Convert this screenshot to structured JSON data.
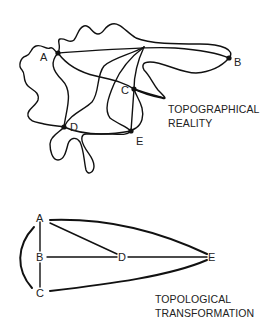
{
  "top_diagram": {
    "caption_lines": [
      "TOPOGRAPHICAL",
      "REALITY"
    ],
    "nodes": {
      "A": {
        "label": "A"
      },
      "B": {
        "label": "B"
      },
      "C": {
        "label": "C"
      },
      "D": {
        "label": "D"
      },
      "E": {
        "label": "E"
      }
    },
    "edges": [
      "A-B",
      "A-C",
      "A-D",
      "B-C",
      "C-E",
      "D-E",
      "D-C",
      "A-E"
    ]
  },
  "bottom_diagram": {
    "caption_lines": [
      "TOPOLOGICAL",
      "TRANSFORMATION"
    ],
    "nodes": {
      "A": {
        "label": "A"
      },
      "B": {
        "label": "B"
      },
      "C": {
        "label": "C"
      },
      "D": {
        "label": "D"
      },
      "E": {
        "label": "E"
      }
    },
    "edges": [
      "A-B",
      "B-C",
      "A-C (arc)",
      "A-D",
      "B-D",
      "D-E",
      "A-E",
      "C-E"
    ]
  },
  "colors": {
    "line": "#111111",
    "background": "#ffffff"
  }
}
